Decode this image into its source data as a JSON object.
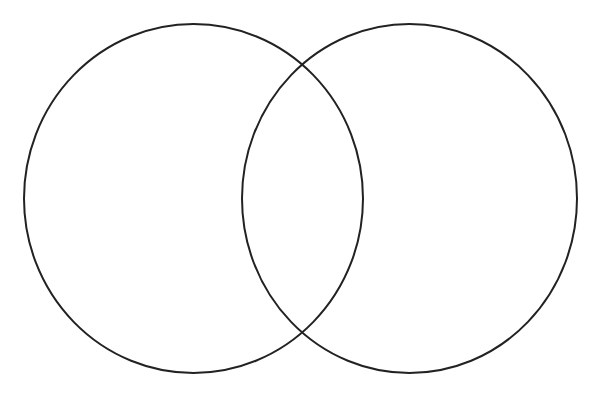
{
  "diagram": {
    "type": "venn",
    "background": "#ffffff",
    "stroke_color": "#222222",
    "stroke_width": 2,
    "sets": [
      {
        "name": "left-set",
        "label": "",
        "cx": 193.5,
        "cy": 198.5,
        "rx": 169.5,
        "ry": 174.5
      },
      {
        "name": "right-set",
        "label": "",
        "cx": 409.5,
        "cy": 198.5,
        "rx": 167.5,
        "ry": 174.5
      }
    ],
    "intersections": [
      {
        "x": 302,
        "y": 65
      },
      {
        "x": 302,
        "y": 333
      }
    ]
  }
}
